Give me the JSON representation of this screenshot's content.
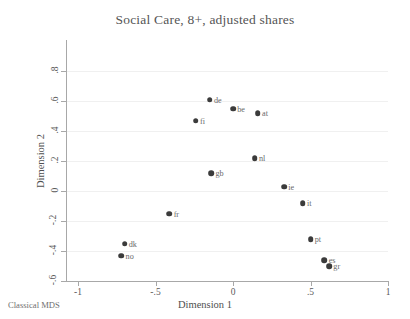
{
  "chart_data": {
    "type": "scatter",
    "title": "Social Care, 8+, adjusted shares",
    "caption": "Classical MDS",
    "xlabel": "Dimension 1",
    "ylabel": "Dimension 2",
    "xlim": [
      -1.12,
      1.12
    ],
    "ylim": [
      -0.68,
      0.85
    ],
    "xticks": [
      "-1",
      "-.5",
      "0",
      ".5",
      "1"
    ],
    "xtick_values": [
      -1,
      -0.5,
      0,
      0.5,
      1
    ],
    "yticks": [
      ".8",
      ".6",
      ".4",
      ".2",
      "0",
      "-.2",
      "-.4",
      "-.6"
    ],
    "ytick_values": [
      0.8,
      0.6,
      0.4,
      0.2,
      0,
      -0.2,
      -0.4,
      -0.6
    ],
    "grid": "horizontal",
    "legend": "none",
    "marker_color": "#3b3b3b",
    "points": [
      {
        "label": "de",
        "x": -0.15,
        "y": 0.61
      },
      {
        "label": "be",
        "x": 0.0,
        "y": 0.55
      },
      {
        "label": "at",
        "x": 0.16,
        "y": 0.52
      },
      {
        "label": "fi",
        "x": -0.24,
        "y": 0.47
      },
      {
        "label": "nl",
        "x": 0.14,
        "y": 0.22
      },
      {
        "label": "gb",
        "x": -0.14,
        "y": 0.12
      },
      {
        "label": "ie",
        "x": 0.33,
        "y": 0.03
      },
      {
        "label": "it",
        "x": 0.45,
        "y": -0.08
      },
      {
        "label": "fr",
        "x": -0.41,
        "y": -0.15
      },
      {
        "label": "pt",
        "x": 0.5,
        "y": -0.32
      },
      {
        "label": "dk",
        "x": -0.7,
        "y": -0.35
      },
      {
        "label": "no",
        "x": -0.72,
        "y": -0.43
      },
      {
        "label": "es",
        "x": 0.59,
        "y": -0.46
      },
      {
        "label": "gr",
        "x": 0.62,
        "y": -0.5
      }
    ]
  }
}
